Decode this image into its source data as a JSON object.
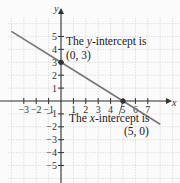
{
  "chart_data": {
    "type": "line",
    "title": "",
    "xlabel": "x",
    "ylabel": "y",
    "xlim": [
      -3.5,
      7.5
    ],
    "ylim": [
      -6,
      6
    ],
    "grid": true,
    "x_ticks": [
      -3,
      -2,
      -1,
      1,
      2,
      3,
      4,
      5,
      6,
      7
    ],
    "y_ticks": [
      5,
      4,
      3,
      2,
      1,
      -1,
      -2,
      -3,
      -4,
      -5
    ],
    "series": [
      {
        "name": "line",
        "equation": "y = -3/5 x + 3",
        "x": [
          -4,
          0,
          5,
          8
        ],
        "y": [
          5.4,
          3,
          0,
          -1.8
        ],
        "color": "#777777"
      }
    ],
    "points": [
      {
        "x": 0,
        "y": 3,
        "label": "(0, 3)"
      },
      {
        "x": 5,
        "y": 0,
        "label": "(5, 0)"
      }
    ],
    "annotations": [
      {
        "line1": "The y-intercept is",
        "line2": "(0, 3)"
      },
      {
        "line1": "The x-intercept is",
        "line2": "(5, 0)"
      }
    ]
  },
  "labels": {
    "x_axis": "x",
    "y_axis": "y",
    "y_intercept_text_pre": "The ",
    "y_intercept_text_var": "y",
    "y_intercept_text_post": "-intercept is",
    "y_intercept_point": "(0, 3)",
    "x_intercept_text_pre": "The ",
    "x_intercept_text_var": "x",
    "x_intercept_text_post": "-intercept is",
    "x_intercept_point": "(5, 0)"
  }
}
